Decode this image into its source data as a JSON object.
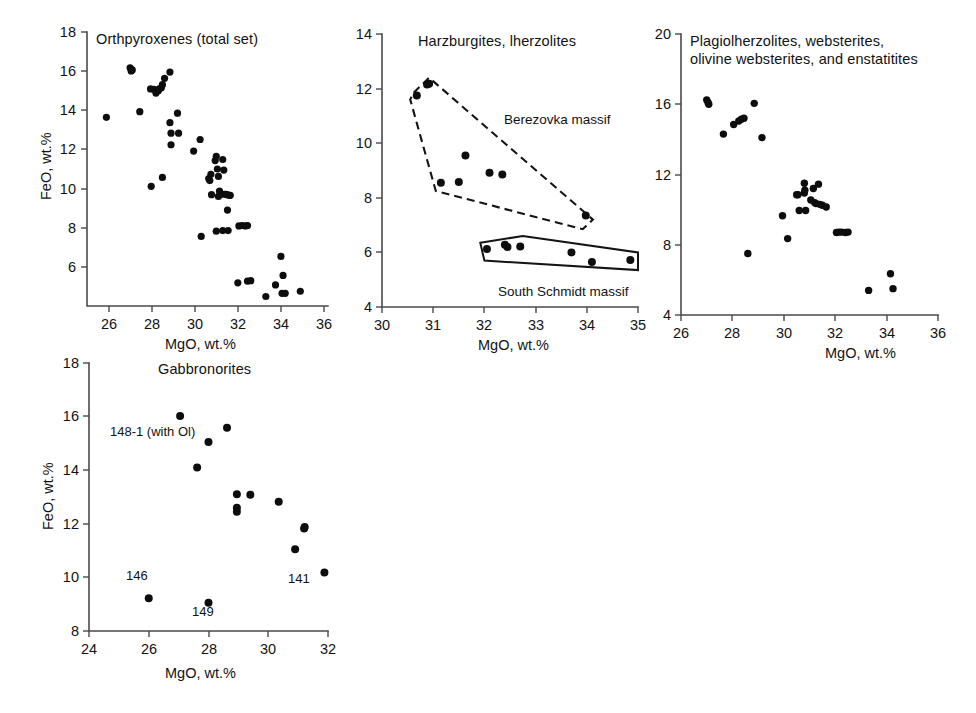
{
  "figure": {
    "background_color": "#ffffff",
    "marker_color": "#0d0d0d",
    "axis_color": "#4a4a4a",
    "panel_count": 4
  },
  "chart_data": [
    {
      "id": "orthopyroxenes-total-set",
      "type": "scatter",
      "title": "Orthpyroxenes (total set)",
      "xlabel": "MgO, wt.%",
      "ylabel": "FeO, wt.%",
      "xlim": [
        25,
        36
      ],
      "ylim": [
        5,
        18
      ],
      "xticks": [
        26,
        28,
        30,
        32,
        34,
        36
      ],
      "yticks": [
        6,
        8,
        10,
        12,
        14,
        16,
        18
      ],
      "xtick_labels": [
        "26",
        "28",
        "30",
        "32",
        "34",
        "36"
      ],
      "ytick_labels": [
        "6",
        "8",
        "10",
        "12",
        "14",
        "16",
        "18"
      ],
      "grid": false,
      "legend": false,
      "points": [
        [
          25.9,
          13.95
        ],
        [
          27.0,
          16.3
        ],
        [
          27.05,
          16.15
        ],
        [
          27.1,
          16.2
        ],
        [
          27.45,
          14.22
        ],
        [
          27.95,
          15.3
        ],
        [
          28.1,
          15.28
        ],
        [
          28.2,
          15.1
        ],
        [
          28.3,
          15.2
        ],
        [
          28.35,
          15.3
        ],
        [
          28.45,
          15.35
        ],
        [
          28.5,
          15.5
        ],
        [
          28.6,
          15.8
        ],
        [
          28.85,
          16.1
        ],
        [
          27.98,
          10.68
        ],
        [
          28.5,
          11.1
        ],
        [
          28.85,
          13.7
        ],
        [
          28.9,
          13.2
        ],
        [
          28.9,
          12.65
        ],
        [
          29.2,
          14.15
        ],
        [
          29.25,
          13.2
        ],
        [
          29.95,
          12.35
        ],
        [
          30.25,
          12.9
        ],
        [
          30.3,
          8.3
        ],
        [
          30.65,
          11.05
        ],
        [
          30.7,
          10.95
        ],
        [
          30.75,
          11.25
        ],
        [
          30.78,
          10.28
        ],
        [
          30.95,
          11.9
        ],
        [
          31.0,
          12.1
        ],
        [
          31.05,
          11.5
        ],
        [
          31.1,
          11.15
        ],
        [
          31.1,
          10.2
        ],
        [
          31.15,
          10.45
        ],
        [
          31.2,
          10.35
        ],
        [
          31.25,
          10.3
        ],
        [
          31.3,
          11.95
        ],
        [
          31.35,
          11.45
        ],
        [
          31.4,
          10.3
        ],
        [
          31.45,
          10.3
        ],
        [
          31.5,
          10.28
        ],
        [
          31.52,
          9.55
        ],
        [
          31.6,
          10.25
        ],
        [
          31.65,
          10.25
        ],
        [
          31.0,
          8.55
        ],
        [
          31.3,
          8.58
        ],
        [
          31.55,
          8.58
        ],
        [
          32.05,
          8.8
        ],
        [
          32.2,
          8.82
        ],
        [
          32.35,
          8.8
        ],
        [
          32.45,
          8.82
        ],
        [
          32.0,
          6.1
        ],
        [
          32.45,
          6.18
        ],
        [
          32.6,
          6.2
        ],
        [
          33.3,
          5.45
        ],
        [
          33.75,
          6.0
        ],
        [
          34.1,
          6.45
        ],
        [
          34.0,
          7.35
        ],
        [
          34.05,
          5.6
        ],
        [
          34.2,
          5.6
        ],
        [
          34.9,
          5.7
        ]
      ]
    },
    {
      "id": "harzburgites-lherzolites",
      "type": "scatter",
      "title": "Harzburgites, lherzolites",
      "xlabel": "MgO, wt.%",
      "ylabel": "",
      "xlim": [
        30,
        35
      ],
      "ylim": [
        4,
        14
      ],
      "xticks": [
        30,
        31,
        32,
        33,
        34,
        35
      ],
      "yticks": [
        4,
        6,
        8,
        10,
        12,
        14
      ],
      "xtick_labels": [
        "30",
        "31",
        "32",
        "33",
        "34",
        "35"
      ],
      "ytick_labels": [
        "4",
        "6",
        "8",
        "10",
        "12",
        "14"
      ],
      "grid": false,
      "legend": false,
      "points": [
        [
          30.68,
          11.75
        ],
        [
          30.88,
          12.15
        ],
        [
          30.92,
          12.18
        ],
        [
          31.15,
          8.55
        ],
        [
          31.5,
          8.58
        ],
        [
          31.63,
          9.55
        ],
        [
          32.1,
          8.92
        ],
        [
          32.35,
          8.85
        ],
        [
          33.98,
          7.35
        ],
        [
          32.05,
          6.12
        ],
        [
          32.4,
          6.28
        ],
        [
          32.45,
          6.2
        ],
        [
          32.7,
          6.22
        ],
        [
          33.7,
          6.0
        ],
        [
          34.1,
          5.65
        ],
        [
          34.85,
          5.72
        ]
      ],
      "annotations": [
        {
          "text": "Berezovka massif",
          "x": 32.4,
          "y": 10.45
        },
        {
          "text": "South Schmidt massif",
          "x": 32.6,
          "y": 4.45
        }
      ],
      "fields": [
        {
          "name": "Berezovka massif",
          "style": "dashed",
          "vertices": [
            [
              30.62,
              11.85
            ],
            [
              30.92,
              12.4
            ],
            [
              34.12,
              7.2
            ],
            [
              33.92,
              6.85
            ],
            [
              31.05,
              8.25
            ],
            [
              30.55,
              11.6
            ]
          ]
        },
        {
          "name": "South Schmidt massif",
          "style": "solid",
          "vertices": [
            [
              31.92,
              6.35
            ],
            [
              32.75,
              6.6
            ],
            [
              35.0,
              6.0
            ],
            [
              35.0,
              5.35
            ],
            [
              32.0,
              5.7
            ],
            [
              31.92,
              6.35
            ]
          ]
        }
      ]
    },
    {
      "id": "plagiolherzolites-websterites",
      "type": "scatter",
      "title": "Plagiolherzolites, websterites, olivine websterites, and enstatitites",
      "title_lines": [
        "Plagiolherzolites, websterites,",
        "olivine websterites, and enstatitites"
      ],
      "xlabel": "MgO, wt.%",
      "ylabel": "",
      "xlim": [
        26,
        36
      ],
      "ylim": [
        4,
        20
      ],
      "xticks": [
        26,
        28,
        30,
        32,
        34,
        36
      ],
      "yticks": [
        4,
        8,
        12,
        16,
        20
      ],
      "xtick_labels": [
        "26",
        "28",
        "30",
        "32",
        "34",
        "36"
      ],
      "ytick_labels": [
        "4",
        "8",
        "12",
        "16",
        "20"
      ],
      "grid": false,
      "legend": false,
      "points": [
        [
          27.0,
          16.25
        ],
        [
          27.05,
          16.1
        ],
        [
          27.08,
          16.0
        ],
        [
          27.65,
          14.3
        ],
        [
          28.05,
          14.85
        ],
        [
          28.25,
          15.05
        ],
        [
          28.35,
          15.15
        ],
        [
          28.45,
          15.2
        ],
        [
          28.85,
          16.05
        ],
        [
          29.15,
          14.1
        ],
        [
          28.6,
          7.5
        ],
        [
          29.95,
          9.65
        ],
        [
          30.15,
          8.35
        ],
        [
          30.5,
          10.85
        ],
        [
          30.55,
          10.85
        ],
        [
          30.6,
          9.95
        ],
        [
          30.8,
          11.5
        ],
        [
          30.8,
          10.95
        ],
        [
          30.82,
          11.1
        ],
        [
          30.85,
          9.95
        ],
        [
          31.05,
          10.55
        ],
        [
          31.15,
          11.2
        ],
        [
          31.2,
          10.4
        ],
        [
          31.25,
          10.35
        ],
        [
          31.35,
          11.45
        ],
        [
          31.4,
          10.3
        ],
        [
          31.5,
          10.25
        ],
        [
          31.65,
          10.15
        ],
        [
          32.05,
          8.7
        ],
        [
          32.15,
          8.72
        ],
        [
          32.25,
          8.72
        ],
        [
          32.4,
          8.7
        ],
        [
          32.5,
          8.72
        ],
        [
          33.3,
          5.4
        ],
        [
          34.15,
          6.35
        ],
        [
          34.25,
          5.5
        ]
      ]
    },
    {
      "id": "gabbronorites",
      "type": "scatter",
      "title": "Gabbronorites",
      "xlabel": "MgO, wt.%",
      "ylabel": "FeO, wt.%",
      "xlim": [
        24,
        32
      ],
      "ylim": [
        8,
        18
      ],
      "xticks": [
        24,
        26,
        28,
        30,
        32
      ],
      "yticks": [
        8,
        10,
        12,
        14,
        16,
        18
      ],
      "xtick_labels": [
        "24",
        "26",
        "28",
        "30",
        "32"
      ],
      "ytick_labels": [
        "8",
        "10",
        "12",
        "14",
        "16",
        "18"
      ],
      "grid": false,
      "legend": false,
      "points": [
        [
          27.05,
          16.02
        ],
        [
          27.62,
          14.1
        ],
        [
          28.0,
          15.05
        ],
        [
          28.0,
          9.05
        ],
        [
          28.62,
          15.58
        ],
        [
          28.95,
          13.1
        ],
        [
          28.95,
          12.6
        ],
        [
          28.95,
          12.45
        ],
        [
          29.4,
          13.08
        ],
        [
          30.35,
          12.82
        ],
        [
          31.2,
          11.82
        ],
        [
          31.22,
          11.88
        ],
        [
          30.9,
          11.05
        ],
        [
          31.88,
          10.18
        ],
        [
          26.0,
          9.22
        ]
      ],
      "point_labels": [
        {
          "text": "148-1 (with Ol)",
          "x": 26.05,
          "y": 15.45,
          "anchor": "start"
        },
        {
          "text": "146",
          "x": 25.6,
          "y": 9.75,
          "anchor": "start"
        },
        {
          "text": "149",
          "x": 27.72,
          "y": 8.5,
          "anchor": "start"
        },
        {
          "text": "141",
          "x": 31.18,
          "y": 10.05,
          "anchor": "start"
        }
      ]
    }
  ]
}
